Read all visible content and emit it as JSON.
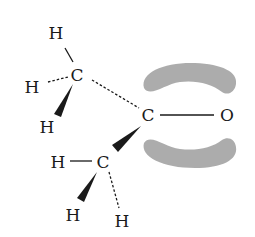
{
  "diagram": {
    "atoms": {
      "h_top": "H",
      "c_methyl_upper": "C",
      "h_left_upper": "H",
      "h_wedge_upper": "H",
      "c_carbonyl": "C",
      "o_carbonyl": "O",
      "h_left_lower": "H",
      "c_methyl_lower": "C",
      "h_wedge_lower": "H",
      "h_dash_lower": "H"
    },
    "colors": {
      "ink": "#1a1a1a",
      "lobe": "#a8a8a8"
    }
  }
}
